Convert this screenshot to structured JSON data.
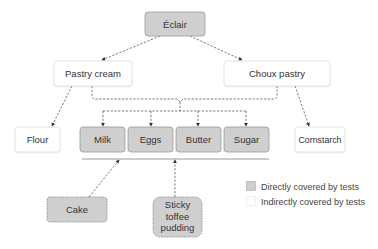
{
  "colors": {
    "direct_fill": "#cfcfcf",
    "direct_stroke": "#9a9a9a",
    "indirect_fill": "#ffffff",
    "indirect_stroke": "#dddddd",
    "connector": "#555555"
  },
  "nodes": {
    "eclair": {
      "label": "Éclair",
      "coverage": "direct"
    },
    "pastry_cream": {
      "label": "Pastry cream",
      "coverage": "indirect"
    },
    "choux_pastry": {
      "label": "Choux pastry",
      "coverage": "indirect"
    },
    "flour": {
      "label": "Flour",
      "coverage": "indirect"
    },
    "milk": {
      "label": "Milk",
      "coverage": "direct"
    },
    "eggs": {
      "label": "Eggs",
      "coverage": "direct"
    },
    "butter": {
      "label": "Butter",
      "coverage": "direct"
    },
    "sugar": {
      "label": "Sugar",
      "coverage": "direct"
    },
    "cornstarch": {
      "label": "Cornstarch",
      "coverage": "indirect"
    },
    "cake": {
      "label": "Cake",
      "coverage": "direct",
      "style": "dashed"
    },
    "sticky_toffee_pudding": {
      "label": "Sticky toffee pudding",
      "lines": [
        "Sticky",
        "toffee",
        "pudding"
      ],
      "coverage": "direct",
      "style": "dashed"
    }
  },
  "edges": [
    {
      "from": "Éclair",
      "to": "Pastry cream"
    },
    {
      "from": "Éclair",
      "to": "Choux pastry"
    },
    {
      "from": "Pastry cream",
      "to": "Flour"
    },
    {
      "from": "Choux pastry",
      "to": "Cornstarch"
    },
    {
      "from": "Pastry cream + Choux pastry",
      "to": [
        "Milk",
        "Eggs",
        "Butter",
        "Sugar"
      ]
    },
    {
      "from": "Cake",
      "to": "Milk/Eggs/Butter/Sugar group"
    },
    {
      "from": "Sticky toffee pudding",
      "to": "Milk/Eggs/Butter/Sugar group"
    }
  ],
  "legend": {
    "items": [
      {
        "label": "Directly covered by tests",
        "swatch": "direct"
      },
      {
        "label": "Indirectly covered by tests",
        "swatch": "indirect"
      }
    ]
  }
}
